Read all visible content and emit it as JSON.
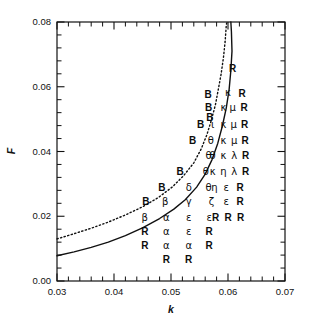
{
  "figure": {
    "background": "#ffffff",
    "ink": "#111111"
  },
  "chart_data": {
    "type": "scatter",
    "title": "",
    "xlabel": "k",
    "ylabel": "F",
    "xlim": [
      0.03,
      0.07
    ],
    "ylim": [
      0.0,
      0.08
    ],
    "grid": false,
    "legend": null,
    "xticks": [
      0.03,
      0.04,
      0.05,
      0.06,
      0.07
    ],
    "xticklabels": [
      "0.03",
      "0.04",
      "0.05",
      "0.06",
      "0.07"
    ],
    "yticks": [
      0.0,
      0.02,
      0.04,
      0.06,
      0.08
    ],
    "yticklabels": [
      "0.00",
      "0.02",
      "0.04",
      "0.06",
      "0.08"
    ],
    "minor_ticks_per_interval": 4,
    "tick_direction": "in",
    "frame": "box",
    "marker_note": "Each plotted point is drawn as a letter glyph (Greek or Roman) denoting the pattern class observed at that (k, F) location.",
    "points": [
      {
        "x": 0.0608,
        "y": 0.0655,
        "label": "R"
      },
      {
        "x": 0.06,
        "y": 0.058,
        "label": "κ"
      },
      {
        "x": 0.0565,
        "y": 0.0575,
        "label": "B"
      },
      {
        "x": 0.0625,
        "y": 0.0578,
        "label": "R"
      },
      {
        "x": 0.0566,
        "y": 0.0535,
        "label": "B"
      },
      {
        "x": 0.0592,
        "y": 0.0533,
        "label": "κ"
      },
      {
        "x": 0.0608,
        "y": 0.0533,
        "label": "μ"
      },
      {
        "x": 0.0628,
        "y": 0.0533,
        "label": "R"
      },
      {
        "x": 0.0568,
        "y": 0.0505,
        "label": "B"
      },
      {
        "x": 0.0552,
        "y": 0.0483,
        "label": "B"
      },
      {
        "x": 0.0573,
        "y": 0.0483,
        "label": "ι"
      },
      {
        "x": 0.0592,
        "y": 0.0483,
        "label": "κ"
      },
      {
        "x": 0.061,
        "y": 0.0483,
        "label": "μ"
      },
      {
        "x": 0.0629,
        "y": 0.0483,
        "label": "R"
      },
      {
        "x": 0.0538,
        "y": 0.0432,
        "label": "B"
      },
      {
        "x": 0.057,
        "y": 0.0432,
        "label": "θ"
      },
      {
        "x": 0.0592,
        "y": 0.0432,
        "label": "κ"
      },
      {
        "x": 0.0611,
        "y": 0.0432,
        "label": "μ"
      },
      {
        "x": 0.063,
        "y": 0.0432,
        "label": "R"
      },
      {
        "x": 0.0566,
        "y": 0.0385,
        "label": "θ"
      },
      {
        "x": 0.0573,
        "y": 0.0385,
        "label": "θ"
      },
      {
        "x": 0.0592,
        "y": 0.0385,
        "label": "κ"
      },
      {
        "x": 0.0611,
        "y": 0.0385,
        "label": "λ"
      },
      {
        "x": 0.0631,
        "y": 0.0385,
        "label": "R"
      },
      {
        "x": 0.0516,
        "y": 0.0338,
        "label": "B"
      },
      {
        "x": 0.0561,
        "y": 0.0338,
        "label": "θ"
      },
      {
        "x": 0.0573,
        "y": 0.0338,
        "label": "κ"
      },
      {
        "x": 0.0592,
        "y": 0.0338,
        "label": "η"
      },
      {
        "x": 0.0611,
        "y": 0.0338,
        "label": "λ"
      },
      {
        "x": 0.0631,
        "y": 0.0338,
        "label": "R"
      },
      {
        "x": 0.0484,
        "y": 0.0288,
        "label": "B"
      },
      {
        "x": 0.0531,
        "y": 0.0288,
        "label": "δ"
      },
      {
        "x": 0.0566,
        "y": 0.0288,
        "label": "θ"
      },
      {
        "x": 0.0576,
        "y": 0.0288,
        "label": "η"
      },
      {
        "x": 0.0597,
        "y": 0.0288,
        "label": "ε"
      },
      {
        "x": 0.0621,
        "y": 0.0288,
        "label": "R"
      },
      {
        "x": 0.0456,
        "y": 0.0243,
        "label": "B"
      },
      {
        "x": 0.049,
        "y": 0.0243,
        "label": "β"
      },
      {
        "x": 0.0531,
        "y": 0.0243,
        "label": "γ"
      },
      {
        "x": 0.0571,
        "y": 0.0243,
        "label": "ζ"
      },
      {
        "x": 0.0597,
        "y": 0.0243,
        "label": "ε"
      },
      {
        "x": 0.0621,
        "y": 0.0243,
        "label": "R"
      },
      {
        "x": 0.0454,
        "y": 0.0196,
        "label": "β"
      },
      {
        "x": 0.0492,
        "y": 0.0196,
        "label": "α"
      },
      {
        "x": 0.0531,
        "y": 0.0196,
        "label": "ε"
      },
      {
        "x": 0.0567,
        "y": 0.0196,
        "label": "ε"
      },
      {
        "x": 0.0578,
        "y": 0.0196,
        "label": "R"
      },
      {
        "x": 0.06,
        "y": 0.0196,
        "label": "R"
      },
      {
        "x": 0.0622,
        "y": 0.0196,
        "label": "R"
      },
      {
        "x": 0.0454,
        "y": 0.0152,
        "label": "R"
      },
      {
        "x": 0.0492,
        "y": 0.0152,
        "label": "α"
      },
      {
        "x": 0.0531,
        "y": 0.0152,
        "label": "ε"
      },
      {
        "x": 0.0567,
        "y": 0.0152,
        "label": "R"
      },
      {
        "x": 0.0454,
        "y": 0.0108,
        "label": "R"
      },
      {
        "x": 0.0492,
        "y": 0.0108,
        "label": "α"
      },
      {
        "x": 0.0531,
        "y": 0.0108,
        "label": "α"
      },
      {
        "x": 0.0567,
        "y": 0.0108,
        "label": "R"
      },
      {
        "x": 0.0492,
        "y": 0.0065,
        "label": "R"
      },
      {
        "x": 0.0531,
        "y": 0.0065,
        "label": "R"
      }
    ],
    "curves": [
      {
        "name": "solid-boundary",
        "style": "solid",
        "color": "#111111",
        "width": 1.4,
        "points": [
          [
            0.03,
            0.0078
          ],
          [
            0.033,
            0.009
          ],
          [
            0.036,
            0.0104
          ],
          [
            0.039,
            0.012
          ],
          [
            0.042,
            0.014
          ],
          [
            0.045,
            0.0164
          ],
          [
            0.048,
            0.0193
          ],
          [
            0.0505,
            0.0222
          ],
          [
            0.0525,
            0.0251
          ],
          [
            0.0545,
            0.029
          ],
          [
            0.056,
            0.033
          ],
          [
            0.0572,
            0.0375
          ],
          [
            0.0582,
            0.0425
          ],
          [
            0.059,
            0.0478
          ],
          [
            0.0597,
            0.0535
          ],
          [
            0.0602,
            0.0592
          ],
          [
            0.0605,
            0.065
          ],
          [
            0.0607,
            0.071
          ],
          [
            0.0606,
            0.077
          ],
          [
            0.0605,
            0.08
          ]
        ]
      },
      {
        "name": "dotted-boundary",
        "style": "dotted",
        "color": "#111111",
        "width": 1.4,
        "points": [
          [
            0.03,
            0.013
          ],
          [
            0.033,
            0.0146
          ],
          [
            0.036,
            0.0163
          ],
          [
            0.039,
            0.0182
          ],
          [
            0.042,
            0.0204
          ],
          [
            0.045,
            0.0229
          ],
          [
            0.0478,
            0.0258
          ],
          [
            0.0502,
            0.029
          ],
          [
            0.0522,
            0.0325
          ],
          [
            0.054,
            0.0365
          ],
          [
            0.0553,
            0.0408
          ],
          [
            0.0563,
            0.0452
          ],
          [
            0.0571,
            0.0498
          ],
          [
            0.0578,
            0.0545
          ],
          [
            0.0583,
            0.0592
          ],
          [
            0.0588,
            0.064
          ],
          [
            0.0592,
            0.069
          ],
          [
            0.0595,
            0.074
          ],
          [
            0.0597,
            0.079
          ],
          [
            0.0598,
            0.08
          ]
        ]
      }
    ]
  }
}
